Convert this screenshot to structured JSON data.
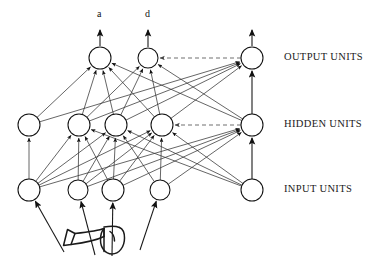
{
  "figure": {
    "type": "neural-network-diagram",
    "background_color": "#ffffff",
    "line_color": "#333333",
    "node_fill": "#ffffff",
    "node_stroke": "#111111"
  },
  "layer_labels": [
    {
      "id": "output",
      "text": "OUTPUT UNITS",
      "x": 284,
      "y": 58
    },
    {
      "id": "hidden",
      "text": "HIDDEN UNITS",
      "x": 284,
      "y": 125
    },
    {
      "id": "input",
      "text": "INPUT UNITS",
      "x": 284,
      "y": 190
    }
  ],
  "node_labels": [
    {
      "id": "label-a",
      "text": "a",
      "x": 100,
      "y": 15
    },
    {
      "id": "label-d",
      "text": "d",
      "x": 148,
      "y": 15
    }
  ],
  "nodes": {
    "output": [
      {
        "id": "o1",
        "x": 100,
        "y": 58,
        "r": 11,
        "label": "a"
      },
      {
        "id": "o2",
        "x": 148,
        "y": 58,
        "r": 10,
        "label": "d"
      },
      {
        "id": "o3",
        "x": 252,
        "y": 58,
        "r": 11,
        "label": ""
      }
    ],
    "hidden": [
      {
        "id": "h1",
        "x": 29,
        "y": 125,
        "r": 11,
        "label": ""
      },
      {
        "id": "h2",
        "x": 79,
        "y": 125,
        "r": 11,
        "label": ""
      },
      {
        "id": "h3",
        "x": 116,
        "y": 125,
        "r": 11,
        "label": ""
      },
      {
        "id": "h4",
        "x": 162,
        "y": 125,
        "r": 11,
        "label": ""
      },
      {
        "id": "h5",
        "x": 252,
        "y": 125,
        "r": 11,
        "label": ""
      }
    ],
    "input": [
      {
        "id": "i1",
        "x": 29,
        "y": 190,
        "r": 11,
        "label": ""
      },
      {
        "id": "i2",
        "x": 78,
        "y": 190,
        "r": 10,
        "label": ""
      },
      {
        "id": "i3",
        "x": 113,
        "y": 190,
        "r": 11,
        "label": ""
      },
      {
        "id": "i4",
        "x": 160,
        "y": 190,
        "r": 10,
        "label": ""
      },
      {
        "id": "i5",
        "x": 252,
        "y": 190,
        "r": 11,
        "label": ""
      }
    ]
  },
  "output_arrows": [
    {
      "id": "arrow-a",
      "from_node": "o1",
      "x": 100,
      "y_top": 30
    },
    {
      "id": "arrow-d",
      "from_node": "o2",
      "x": 148,
      "y_top": 30
    },
    {
      "id": "arrow-right",
      "from_node": "o3",
      "x": 252,
      "y_top": 30
    }
  ],
  "edges": {
    "hidden_to_output": [
      [
        "h1",
        "o1"
      ],
      [
        "h2",
        "o1"
      ],
      [
        "h3",
        "o1"
      ],
      [
        "h4",
        "o1"
      ],
      [
        "h5",
        "o1"
      ],
      [
        "h2",
        "o2"
      ],
      [
        "h3",
        "o2"
      ],
      [
        "h4",
        "o2"
      ],
      [
        "h5",
        "o2"
      ],
      [
        "h1",
        "o3"
      ],
      [
        "h2",
        "o3"
      ],
      [
        "h3",
        "o3"
      ],
      [
        "h4",
        "o3"
      ]
    ],
    "input_to_hidden": [
      [
        "i1",
        "h1"
      ],
      [
        "i1",
        "h2"
      ],
      [
        "i1",
        "h3"
      ],
      [
        "i1",
        "h4"
      ],
      [
        "i1",
        "h5"
      ],
      [
        "i2",
        "h2"
      ],
      [
        "i2",
        "h3"
      ],
      [
        "i2",
        "h4"
      ],
      [
        "i2",
        "h5"
      ],
      [
        "i3",
        "h2"
      ],
      [
        "i3",
        "h3"
      ],
      [
        "i3",
        "h4"
      ],
      [
        "i3",
        "h5"
      ],
      [
        "i4",
        "h3"
      ],
      [
        "i4",
        "h4"
      ],
      [
        "i4",
        "h5"
      ],
      [
        "i5",
        "h2"
      ],
      [
        "i5",
        "h3"
      ],
      [
        "i5",
        "h4"
      ]
    ],
    "vertical": [
      [
        "i5",
        "h5"
      ],
      [
        "h5",
        "o3"
      ]
    ],
    "dashed": [
      {
        "from": "o3",
        "to": "o2",
        "layer": "output"
      },
      {
        "from": "h5",
        "to": "h4",
        "layer": "hidden"
      }
    ]
  },
  "stimulus_icon": {
    "id": "trumpet",
    "name": "trumpet-icon",
    "description": "hand-drawn trumpet / horn line art",
    "arrows_to_inputs": [
      "i1",
      "i2",
      "i3",
      "i4"
    ]
  }
}
